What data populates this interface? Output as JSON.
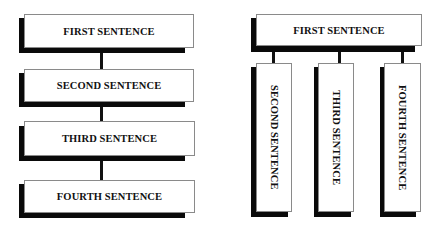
{
  "left_diagram": {
    "layout": "vertical-chain",
    "boxes": [
      {
        "label": "FIRST SENTENCE"
      },
      {
        "label": "SECOND SENTENCE"
      },
      {
        "label": "THIRD SENTENCE"
      },
      {
        "label": "FOURTH SENTENCE"
      }
    ]
  },
  "right_diagram": {
    "layout": "tree",
    "root": {
      "label": "FIRST SENTENCE"
    },
    "children": [
      {
        "label": "SECOND SENTENCE"
      },
      {
        "label": "THIRD SENTENCE"
      },
      {
        "label": "FOURTH SENTENCE"
      }
    ]
  },
  "colors": {
    "shadow": "#0a0a0a",
    "box_border": "#8a8a8a",
    "box_fill": "#ffffff",
    "text": "#111111"
  }
}
